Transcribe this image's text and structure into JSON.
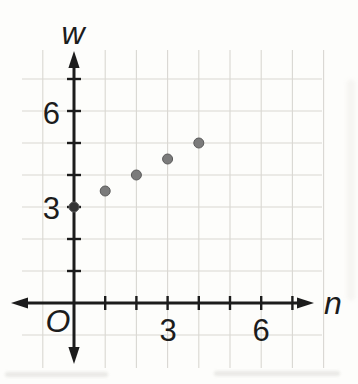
{
  "figure": {
    "kind": "coordinate-grid-scatter-plot",
    "background": "#fdfdfb"
  },
  "chart_data": {
    "type": "scatter",
    "title": "",
    "xlabel": "n",
    "ylabel": "w",
    "origin_label": "O",
    "points": [
      {
        "n": 0,
        "w": 3
      },
      {
        "n": 1,
        "w": 3.5
      },
      {
        "n": 2,
        "w": 4
      },
      {
        "n": 3,
        "w": 4.5
      },
      {
        "n": 4,
        "w": 5
      }
    ],
    "relationship_hint": "w = 3 + 0.5n",
    "xlim": [
      -2,
      8
    ],
    "ylim": [
      -2,
      8
    ],
    "x_tick_positions": [
      1,
      2,
      3,
      4,
      5,
      6,
      7
    ],
    "y_tick_positions": [
      1,
      2,
      3,
      4,
      5,
      6,
      7
    ],
    "x_tick_labels": [
      {
        "value": 3,
        "label": "3"
      },
      {
        "value": 6,
        "label": "6"
      }
    ],
    "y_tick_labels": [
      {
        "value": 3,
        "label": "3"
      },
      {
        "value": 6,
        "label": "6"
      }
    ],
    "grid": true,
    "grid_x": [
      -1,
      1,
      2,
      3,
      4,
      5,
      6,
      7,
      8
    ],
    "grid_y": [
      -1,
      1,
      2,
      3,
      4,
      5,
      6,
      7
    ],
    "legend": null,
    "colors": {
      "axis": "#1c1c1c",
      "grid": "#d9d7d2",
      "point_fill": "#7b7b7b",
      "point_stroke": "#5a5a5a",
      "origin_point_fill": "#333333",
      "label": "#1c1c1c"
    }
  }
}
